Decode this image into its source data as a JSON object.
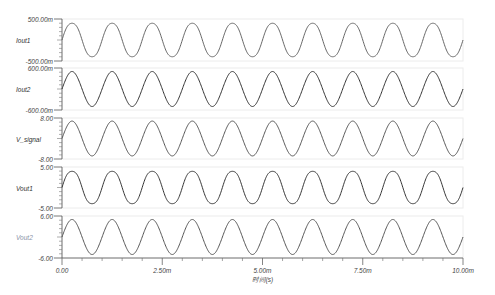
{
  "chart_data": {
    "type": "line",
    "title": "",
    "xlabel": "时间(s)",
    "x_unit": "s",
    "xlim": [
      0,
      0.01
    ],
    "x_ticks": [
      {
        "value": 0.0,
        "label": "0.00"
      },
      {
        "value": 0.0025,
        "label": "2.50m"
      },
      {
        "value": 0.005,
        "label": "5.00m"
      },
      {
        "value": 0.0075,
        "label": "7.50m"
      },
      {
        "value": 0.01,
        "label": "10.00m"
      }
    ],
    "grid": false,
    "legend": "none",
    "layout": "stacked",
    "series": [
      {
        "name": "Iout1",
        "ylabel": "Iout1",
        "ylim": [
          -0.5,
          0.5
        ],
        "y_top_label": "500.00m",
        "y_bottom_label": "-500.00m",
        "frequency_hz": 1000,
        "amplitude": 0.42,
        "phase_deg": 0,
        "distortion": 0.05,
        "cycles": 10,
        "label_color": "#333333",
        "line_color": "#666666"
      },
      {
        "name": "Iout2",
        "ylabel": "Iout2",
        "ylim": [
          -0.6,
          0.6
        ],
        "y_top_label": "600.00m",
        "y_bottom_label": "-600.00m",
        "frequency_hz": 1000,
        "amplitude": 0.5,
        "phase_deg": 0,
        "distortion": 0.0,
        "cycles": 10,
        "label_color": "#333333",
        "line_color": "#333333"
      },
      {
        "name": "V_signal",
        "ylabel": "V_signal",
        "ylim": [
          -8,
          8
        ],
        "y_top_label": "8.00",
        "y_bottom_label": "-8.00",
        "frequency_hz": 1000,
        "amplitude": 6.8,
        "phase_deg": 0,
        "distortion": 0.0,
        "cycles": 10,
        "label_color": "#333333",
        "line_color": "#555555"
      },
      {
        "name": "Vout1",
        "ylabel": "Vout1",
        "ylim": [
          -5,
          5
        ],
        "y_top_label": "5.00",
        "y_bottom_label": "-5.00",
        "frequency_hz": 1000,
        "amplitude": 4.2,
        "phase_deg": 0,
        "distortion": 0.06,
        "cycles": 10,
        "label_color": "#333333",
        "line_color": "#333333"
      },
      {
        "name": "Vout2",
        "ylabel": "Vout2",
        "ylim": [
          -6,
          6
        ],
        "y_top_label": "6.00",
        "y_bottom_label": "-6.00",
        "frequency_hz": 1000,
        "amplitude": 5.0,
        "phase_deg": 0,
        "distortion": 0.0,
        "cycles": 10,
        "label_color": "#8a93a8",
        "line_color": "#555555"
      }
    ]
  },
  "layout_hint": {
    "plot_left": 62,
    "plot_right": 463,
    "panels_top": [
      19,
      68,
      118,
      167,
      216
    ],
    "panels_bottom": [
      61,
      110,
      159,
      208,
      258
    ],
    "axis_y": 258,
    "x_tick_label_y": 273,
    "xlabel_y": 282
  }
}
